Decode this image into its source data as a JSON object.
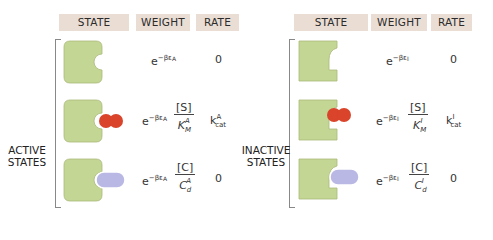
{
  "headers": {
    "left": [
      "STATE",
      "WEIGHT",
      "RATE"
    ],
    "right": [
      "STATE",
      "WEIGHT",
      "RATE"
    ]
  },
  "groups": {
    "active": {
      "label_line1": "ACTIVE",
      "label_line2": "STATES",
      "rows": [
        {
          "state": "empty",
          "weight_base": "e",
          "weight_exp": "−βε",
          "weight_exp_sub": "A",
          "frac_num": "",
          "frac_den": "",
          "frac_den_sub": "",
          "frac_den_sup": "",
          "rate": "0",
          "rate_sup": "",
          "rate_sub": ""
        },
        {
          "state": "substrate-bound",
          "weight_base": "e",
          "weight_exp": "−βε",
          "weight_exp_sub": "A",
          "frac_num": "[S]",
          "frac_den": "K",
          "frac_den_sub": "M",
          "frac_den_sup": "A",
          "rate": "k",
          "rate_sup": "A",
          "rate_sub": "cat"
        },
        {
          "state": "competitor-bound",
          "weight_base": "e",
          "weight_exp": "−βε",
          "weight_exp_sub": "A",
          "frac_num": "[C]",
          "frac_den": "C",
          "frac_den_sub": "d",
          "frac_den_sup": "A",
          "rate": "0",
          "rate_sup": "",
          "rate_sub": ""
        }
      ]
    },
    "inactive": {
      "label_line1": "INACTIVE",
      "label_line2": "STATES",
      "rows": [
        {
          "state": "empty",
          "weight_base": "e",
          "weight_exp": "−βε",
          "weight_exp_sub": "I",
          "frac_num": "",
          "frac_den": "",
          "frac_den_sub": "",
          "frac_den_sup": "",
          "rate": "0",
          "rate_sup": "",
          "rate_sub": ""
        },
        {
          "state": "substrate-bound",
          "weight_base": "e",
          "weight_exp": "−βε",
          "weight_exp_sub": "I",
          "frac_num": "[S]",
          "frac_den": "K",
          "frac_den_sub": "M",
          "frac_den_sup": "I",
          "rate": "k",
          "rate_sup": "I",
          "rate_sub": "cat"
        },
        {
          "state": "competitor-bound",
          "weight_base": "e",
          "weight_exp": "−βε",
          "weight_exp_sub": "I",
          "frac_num": "[C]",
          "frac_den": "C",
          "frac_den_sub": "d",
          "frac_den_sup": "I",
          "rate": "0",
          "rate_sup": "",
          "rate_sub": ""
        }
      ]
    }
  },
  "colors": {
    "header_bg": "#eaded4",
    "enzyme": "#c3d694",
    "enzyme_stroke": "#9fb070",
    "substrate": "#d9442a",
    "competitor": "#b9b8e4"
  }
}
